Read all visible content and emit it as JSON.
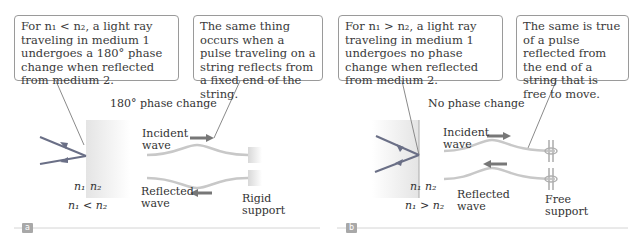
{
  "panels": [
    {
      "tag": "a",
      "callout_left": "For n₁ < n₂, a light ray traveling in medium 1 undergoes a 180° phase change when reflected from medium 2.",
      "callout_right": "The same thing occurs when a pulse traveling on a string reflects from a fixed end of the string.",
      "phase_label": "180° phase change",
      "medium_left": "n₁",
      "medium_right": "n₂",
      "relation": "n₁ < n₂",
      "incident_label_1": "Incident",
      "incident_label_2": "wave",
      "reflected_label_1": "Reflected",
      "reflected_label_2": "wave",
      "support_label_1": "Rigid",
      "support_label_2": "support"
    },
    {
      "tag": "b",
      "callout_left": "For n₁ > n₂, a light ray traveling in medium 1 undergoes no phase change when reflected from medium 2.",
      "callout_right": "The same is true of a pulse reflected from the end of a string that is free to move.",
      "phase_label": "No phase change",
      "medium_left": "n₁",
      "medium_right": "n₂",
      "relation": "n₁ > n₂",
      "incident_label_1": "Incident",
      "incident_label_2": "wave",
      "reflected_label_1": "Reflected",
      "reflected_label_2": "wave",
      "support_label_1": "Free",
      "support_label_2": "support"
    }
  ],
  "colors": {
    "ray": "#6a6f86",
    "arrow": "#777777",
    "string": "#c8c8c8",
    "medium": "#ececec",
    "tag_bg": "#a8a8a8"
  }
}
